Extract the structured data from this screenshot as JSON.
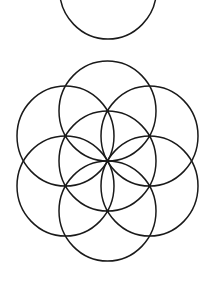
{
  "diagram": {
    "type": "seed-of-life",
    "background": "#ffffff",
    "stroke_color": "#1a1a1a",
    "stroke_width": 1.5,
    "dot_radius": 1.6,
    "x_scale": 0.97,
    "top_circle": {
      "cx": 108,
      "cy": -11,
      "r": 50
    },
    "flower": {
      "cx": 107.5,
      "cy": 161,
      "r": 50,
      "circle_count": 7,
      "petal_count": 6,
      "intersection_dots": 7
    }
  }
}
